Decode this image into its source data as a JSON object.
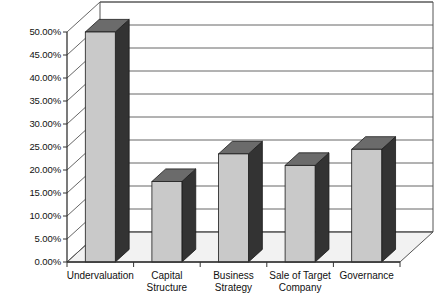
{
  "chart_data": {
    "type": "bar",
    "title": "",
    "subtitle": "",
    "xlabel": "",
    "ylabel": "",
    "categories": [
      "Undervaluation",
      "Capital\nStructure",
      "Business\nStrategy",
      "Sale of Target\nCompany",
      "Governance"
    ],
    "values": [
      0.5,
      0.175,
      0.235,
      0.21,
      0.245
    ],
    "value_labels": [
      "50.00%",
      "17.50%",
      "23.50%",
      "21.00%",
      "24.50%"
    ],
    "ylim": [
      0,
      0.5
    ],
    "ytick_values": [
      0.0,
      0.05,
      0.1,
      0.15,
      0.2,
      0.25,
      0.3,
      0.35,
      0.4,
      0.45,
      0.5
    ],
    "ytick_labels": [
      "0.00%",
      "5.00%",
      "10.00%",
      "15.00%",
      "20.00%",
      "25.00%",
      "30.00%",
      "35.00%",
      "40.00%",
      "45.00%",
      "50.00%"
    ],
    "grid": true,
    "grid_axis": "y",
    "legend": false,
    "legend_position": "none",
    "style": "3d-column",
    "colors": {
      "bar_front": "#c9c9c9",
      "bar_side": "#333333",
      "bar_top": "#6b6b6b",
      "grid_line": "#555555",
      "axis_line": "#333333",
      "floor": "#f2f2f2",
      "background": "#ffffff",
      "text": "#111111"
    }
  }
}
